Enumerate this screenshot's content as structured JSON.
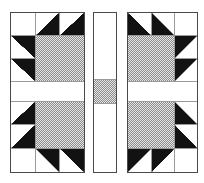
{
  "diagram": {
    "canvas": {
      "width": 204,
      "height": 183,
      "background": "#ffffff"
    },
    "colors": {
      "background": "#ffffff",
      "claw_black": "#121212",
      "block_outline": "#4a4a4a",
      "grid_line": "#9a9a9a",
      "halftone_dark": "#8a8a8a",
      "halftone_light": "#e8e8e8"
    },
    "blocks": [
      {
        "name": "left-paw-block",
        "x": 10,
        "y": 12,
        "w": 75,
        "h": 161,
        "cols": [
          25,
          25,
          25
        ],
        "rows": [
          23,
          23,
          23,
          20,
          24,
          24,
          24
        ],
        "cells": [
          {
            "r": 1,
            "c": 1,
            "type": "plain",
            "name": "corner-square"
          },
          {
            "r": 1,
            "c": 2,
            "type": "tri-br",
            "name": "claw-triangle"
          },
          {
            "r": 1,
            "c": 3,
            "type": "tri-br",
            "name": "claw-triangle"
          },
          {
            "r": 2,
            "c": 1,
            "type": "tri-tr",
            "name": "claw-triangle"
          },
          {
            "r": 2,
            "c": 2,
            "rs": 2,
            "cs": 2,
            "type": "pad",
            "name": "paw-pad"
          },
          {
            "r": 3,
            "c": 1,
            "type": "tri-tr",
            "name": "claw-triangle"
          },
          {
            "r": 4,
            "c": 1,
            "cs": 3,
            "type": "plain",
            "name": "sashing-band"
          },
          {
            "r": 5,
            "c": 1,
            "type": "tri-br",
            "name": "claw-triangle"
          },
          {
            "r": 5,
            "c": 2,
            "rs": 2,
            "cs": 2,
            "type": "pad",
            "name": "paw-pad"
          },
          {
            "r": 6,
            "c": 1,
            "type": "tri-br",
            "name": "claw-triangle"
          },
          {
            "r": 7,
            "c": 1,
            "type": "plain",
            "name": "corner-square"
          },
          {
            "r": 7,
            "c": 2,
            "type": "tri-tr",
            "name": "claw-triangle"
          },
          {
            "r": 7,
            "c": 3,
            "type": "tri-tr",
            "name": "claw-triangle"
          }
        ]
      },
      {
        "name": "center-sashing-strip",
        "x": 93,
        "y": 12,
        "w": 24,
        "h": 161,
        "cols": [
          24
        ],
        "rows": [
          68,
          23,
          70
        ],
        "cells": [
          {
            "r": 1,
            "c": 1,
            "type": "plain",
            "name": "sashing-strip"
          },
          {
            "r": 2,
            "c": 1,
            "type": "pad",
            "name": "cornerstone-square"
          },
          {
            "r": 3,
            "c": 1,
            "type": "plain",
            "name": "sashing-strip"
          }
        ]
      },
      {
        "name": "right-paw-block",
        "x": 127,
        "y": 12,
        "w": 71,
        "h": 161,
        "cols": [
          24,
          24,
          23
        ],
        "rows": [
          23,
          23,
          23,
          20,
          24,
          24,
          24
        ],
        "cells": [
          {
            "r": 1,
            "c": 1,
            "type": "tri-bl",
            "name": "claw-triangle"
          },
          {
            "r": 1,
            "c": 2,
            "type": "tri-bl",
            "name": "claw-triangle"
          },
          {
            "r": 1,
            "c": 3,
            "type": "plain",
            "name": "corner-square"
          },
          {
            "r": 2,
            "c": 1,
            "rs": 2,
            "cs": 2,
            "type": "pad",
            "name": "paw-pad"
          },
          {
            "r": 2,
            "c": 3,
            "type": "tri-tl",
            "name": "claw-triangle"
          },
          {
            "r": 3,
            "c": 3,
            "type": "tri-tl",
            "name": "claw-triangle"
          },
          {
            "r": 4,
            "c": 1,
            "cs": 3,
            "type": "plain",
            "name": "sashing-band"
          },
          {
            "r": 5,
            "c": 1,
            "rs": 2,
            "cs": 2,
            "type": "pad",
            "name": "paw-pad"
          },
          {
            "r": 5,
            "c": 3,
            "type": "tri-bl",
            "name": "claw-triangle"
          },
          {
            "r": 6,
            "c": 3,
            "type": "tri-bl",
            "name": "claw-triangle"
          },
          {
            "r": 7,
            "c": 1,
            "type": "tri-tl",
            "name": "claw-triangle"
          },
          {
            "r": 7,
            "c": 2,
            "type": "tri-tl",
            "name": "claw-triangle"
          },
          {
            "r": 7,
            "c": 3,
            "type": "plain",
            "name": "corner-square"
          }
        ]
      }
    ]
  }
}
